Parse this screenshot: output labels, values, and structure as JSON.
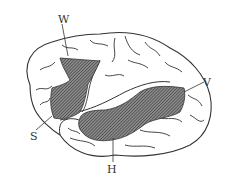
{
  "diagram": {
    "labels": [
      {
        "id": "W",
        "text": "W",
        "x": 58,
        "y": 14
      },
      {
        "id": "S",
        "text": "S",
        "x": 30,
        "y": 131
      },
      {
        "id": "V",
        "text": "V",
        "x": 203,
        "y": 77
      },
      {
        "id": "H",
        "text": "H",
        "x": 107,
        "y": 164
      }
    ],
    "colors": {
      "outline": "#333333",
      "hatch": "#555555",
      "background": "#ffffff"
    }
  }
}
